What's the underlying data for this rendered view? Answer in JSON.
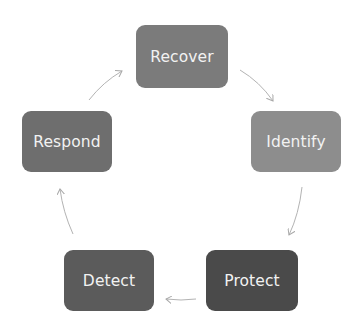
{
  "diagram": {
    "type": "cycle",
    "nodes": [
      {
        "id": "recover",
        "label": "Recover",
        "color": "#7b7b7b",
        "x": 136,
        "y": 25,
        "w": 92,
        "h": 63
      },
      {
        "id": "identify",
        "label": "Identify",
        "color": "#8d8d8d",
        "x": 251,
        "y": 111,
        "w": 90,
        "h": 61
      },
      {
        "id": "protect",
        "label": "Protect",
        "color": "#4a4a4a",
        "x": 206,
        "y": 250,
        "w": 92,
        "h": 61
      },
      {
        "id": "detect",
        "label": "Detect",
        "color": "#5b5b5b",
        "x": 64,
        "y": 250,
        "w": 90,
        "h": 61
      },
      {
        "id": "respond",
        "label": "Respond",
        "color": "#6e6e6e",
        "x": 22,
        "y": 111,
        "w": 90,
        "h": 61
      }
    ],
    "edges": [
      {
        "from": "recover",
        "to": "identify"
      },
      {
        "from": "identify",
        "to": "protect"
      },
      {
        "from": "protect",
        "to": "detect"
      },
      {
        "from": "detect",
        "to": "respond"
      },
      {
        "from": "respond",
        "to": "recover"
      }
    ],
    "arrow_color": "#b0b0b0"
  }
}
